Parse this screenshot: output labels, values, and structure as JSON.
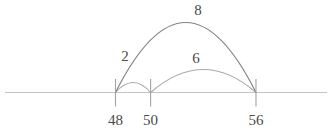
{
  "diagram": {
    "type": "number-line-with-arcs",
    "ticks": [
      {
        "value": 48,
        "label": "48"
      },
      {
        "value": 50,
        "label": "50"
      },
      {
        "value": 56,
        "label": "56"
      }
    ],
    "arcs": [
      {
        "label": "2",
        "from": 48,
        "to": 50,
        "span": 2
      },
      {
        "label": "6",
        "from": 50,
        "to": 56,
        "span": 6
      },
      {
        "label": "8",
        "from": 48,
        "to": 56,
        "span": 8
      }
    ],
    "colors": {
      "background": "#ffffff",
      "number_line": "#c3c3c3",
      "tick": "#a3a3a3",
      "arc_big": "#828282",
      "arc_small": "#aaaaaa",
      "text": "#4a4a4a"
    }
  }
}
